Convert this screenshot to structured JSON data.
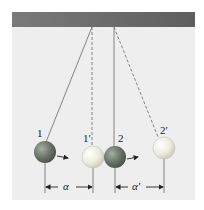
{
  "figure": {
    "labels": {
      "ball1": "1",
      "ball1_prime": "1′",
      "ball2": "2",
      "ball2_prime": "2′",
      "distance1": "α",
      "distance2": "α′"
    },
    "colors": {
      "background": "#eeeeee",
      "ceiling": "#6a6a6a",
      "dark_ball": "#6f7a6f",
      "light_ball": "#ececdc",
      "string": "#777777"
    }
  }
}
